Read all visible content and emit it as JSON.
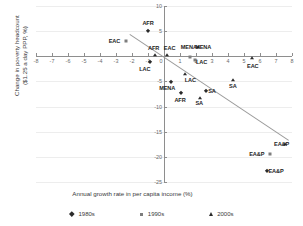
{
  "chart_data": {
    "type": "scatter",
    "title": "",
    "xlabel": "Annual growth rate in per capita income (%)",
    "ylabel": "Change in poverty headcount\n($1.25 a day PPP, %)",
    "xlim": [
      -8,
      8
    ],
    "ylim": [
      -25,
      10
    ],
    "xticks": [
      -8,
      -7,
      -6,
      -5,
      -4,
      -3,
      -2,
      -1,
      0,
      1,
      2,
      3,
      4,
      5,
      6,
      7,
      8
    ],
    "yticks": [
      10,
      5,
      0,
      -5,
      -10,
      -15,
      -20,
      -25
    ],
    "grid": "horizontal",
    "legend_position": "bottom",
    "series": [
      {
        "name": "1980s",
        "marker": "diamond",
        "color": "#2b2b2b",
        "points": [
          {
            "label": "AFR",
            "x": -1.0,
            "y": 5.0,
            "lx": -1.0,
            "ly": 6.6
          },
          {
            "label": "LAC",
            "x": -0.9,
            "y": -1.2,
            "lx": -1.2,
            "ly": -2.6
          },
          {
            "label": "MENA",
            "x": 0.45,
            "y": -5.2,
            "lx": 0.2,
            "ly": -6.4
          },
          {
            "label": "AFR",
            "x": 1.05,
            "y": -7.3,
            "lx": 1.0,
            "ly": -8.7
          },
          {
            "label": "SA",
            "x": 2.65,
            "y": -7.0,
            "lx": 3.0,
            "ly": -6.9
          },
          {
            "label": "EA&P",
            "x": 6.45,
            "y": -22.8,
            "lx": 7.0,
            "ly": -22.8
          }
        ]
      },
      {
        "name": "1990s",
        "marker": "square",
        "color": "#7d7d7d",
        "points": [
          {
            "label": "EAC",
            "x": -2.35,
            "y": 3.0,
            "lx": -3.1,
            "ly": 3.0
          },
          {
            "label": "MENA",
            "x": 1.62,
            "y": -0.15,
            "lx": 1.55,
            "ly": 1.75
          },
          {
            "label": "LAC",
            "x": 1.95,
            "y": -0.75,
            "lx": 2.35,
            "ly": -1.1
          },
          {
            "label": "EA&P",
            "x": 6.6,
            "y": -19.4,
            "lx": 5.8,
            "ly": -19.4
          }
        ]
      },
      {
        "name": "2000s",
        "marker": "triangle",
        "color": "#2b2b2b",
        "points": [
          {
            "label": "AFR",
            "x": -0.55,
            "y": 0.35,
            "lx": -0.65,
            "ly": 1.55
          },
          {
            "label": "EAC",
            "x": 0.18,
            "y": 0.3,
            "lx": 0.35,
            "ly": 1.6
          },
          {
            "label": "MENA",
            "x": 2.15,
            "y": 1.75,
            "lx": 2.45,
            "ly": 1.75
          },
          {
            "label": "LAC",
            "x": 1.3,
            "y": -3.5,
            "lx": 1.65,
            "ly": -4.7
          },
          {
            "label": "SA",
            "x": 2.25,
            "y": -8.3,
            "lx": 2.2,
            "ly": -9.3
          },
          {
            "label": "SA",
            "x": 4.3,
            "y": -4.7,
            "lx": 4.3,
            "ly": -5.9
          },
          {
            "label": "EAC",
            "x": 5.5,
            "y": -0.4,
            "lx": 5.55,
            "ly": -1.9
          },
          {
            "label": "EA&P",
            "x": 7.55,
            "y": -17.4,
            "lx": 7.35,
            "ly": -17.4
          }
        ]
      }
    ],
    "trendline": {
      "x1": -2.1,
      "y1": 4.4,
      "x2": 7.85,
      "y2": -16.7,
      "color": "#9a9a9a"
    }
  },
  "legend": {
    "items": [
      {
        "label": "1980s",
        "marker": "diamond"
      },
      {
        "label": "1990s",
        "marker": "square"
      },
      {
        "label": "2000s",
        "marker": "triangle"
      }
    ]
  }
}
